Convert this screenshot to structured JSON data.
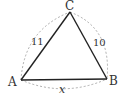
{
  "diagram": {
    "type": "triangle",
    "vertices": {
      "A": {
        "label": "A",
        "x": 21,
        "y": 80
      },
      "B": {
        "label": "B",
        "x": 107,
        "y": 79
      },
      "C": {
        "label": "C",
        "x": 70,
        "y": 12
      }
    },
    "sides": {
      "AC": {
        "label": "11"
      },
      "CB": {
        "label": "10"
      },
      "AB": {
        "label": "x"
      }
    },
    "colors": {
      "edge": "#222222",
      "arc": "#999999"
    }
  }
}
